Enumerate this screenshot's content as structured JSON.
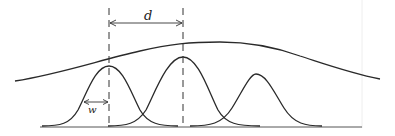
{
  "diagram": {
    "labels": {
      "separation": "d",
      "width": "w"
    },
    "elements": {
      "envelope_curve": "broad bell-shaped envelope spanning the figure",
      "peaks": 3,
      "dashed_guides": 2,
      "dimension_arrows": [
        "d (peak-to-peak separation)",
        "w (half-width)"
      ]
    },
    "colors": {
      "line": "#2a2a2a",
      "background": "#ffffff"
    }
  }
}
